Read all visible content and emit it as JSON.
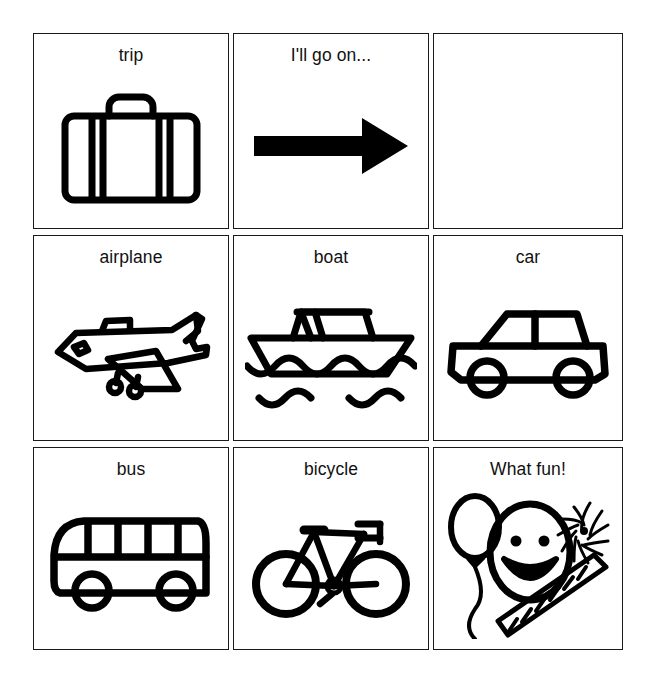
{
  "board": {
    "type": "picture-communication-board",
    "rows": 3,
    "columns": 3,
    "colors": {
      "ink": "#000000",
      "border": "#1a1a1a",
      "background": "#ffffff",
      "text": "#111111"
    },
    "cells": [
      {
        "id": "trip",
        "label": "trip",
        "icon": "suitcase-icon",
        "row": 1,
        "col": 1,
        "empty": false
      },
      {
        "id": "go-on",
        "label": "I'll go on...",
        "icon": "right-arrow-icon",
        "row": 1,
        "col": 2,
        "empty": false
      },
      {
        "id": "answer",
        "label": "",
        "icon": "",
        "row": 1,
        "col": 3,
        "empty": true
      },
      {
        "id": "airplane",
        "label": "airplane",
        "icon": "airplane-icon",
        "row": 2,
        "col": 1,
        "empty": false
      },
      {
        "id": "boat",
        "label": "boat",
        "icon": "boat-icon",
        "row": 2,
        "col": 2,
        "empty": false
      },
      {
        "id": "car",
        "label": "car",
        "icon": "car-icon",
        "row": 2,
        "col": 3,
        "empty": false
      },
      {
        "id": "bus",
        "label": "bus",
        "icon": "bus-icon",
        "row": 3,
        "col": 1,
        "empty": false
      },
      {
        "id": "bicycle",
        "label": "bicycle",
        "icon": "bicycle-icon",
        "row": 3,
        "col": 2,
        "empty": false
      },
      {
        "id": "whatfun",
        "label": "What fun!",
        "icon": "celebration-icon",
        "row": 3,
        "col": 3,
        "empty": false
      }
    ]
  }
}
